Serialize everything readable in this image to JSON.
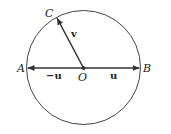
{
  "diagram": {
    "points": {
      "A": "A",
      "B": "B",
      "C": "C",
      "O": "O"
    },
    "vectors": {
      "u": "u",
      "neg_u": "−u",
      "v": "v"
    },
    "colors": {
      "stroke": "#333333",
      "background": "#ffffff"
    }
  }
}
